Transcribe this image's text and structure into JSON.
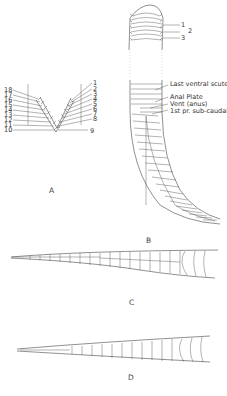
{
  "figure": {
    "panels": [
      {
        "id": "A",
        "caption": "A",
        "description": "V-shaped cross-section showing dorsal scale rows counted",
        "left_labels": [
          "18",
          "17",
          "16",
          "15",
          "14",
          "13",
          "12",
          "11",
          "10"
        ],
        "right_labels": [
          "1",
          "2",
          "3",
          "4",
          "5",
          "6",
          "7",
          "8",
          "9"
        ]
      },
      {
        "id": "B",
        "caption": "B",
        "description": "Ventral view of snake with tail",
        "top_labels": [
          "1",
          "2",
          "3"
        ],
        "annotations": [
          "Last ventral scute",
          "Anal Plate",
          "Vent (anus)",
          "1st pr. sub-caudals"
        ]
      },
      {
        "id": "C",
        "caption": "C",
        "description": "Tail with paired subcaudals"
      },
      {
        "id": "D",
        "caption": "D",
        "description": "Tail with single subcaudals"
      }
    ]
  }
}
